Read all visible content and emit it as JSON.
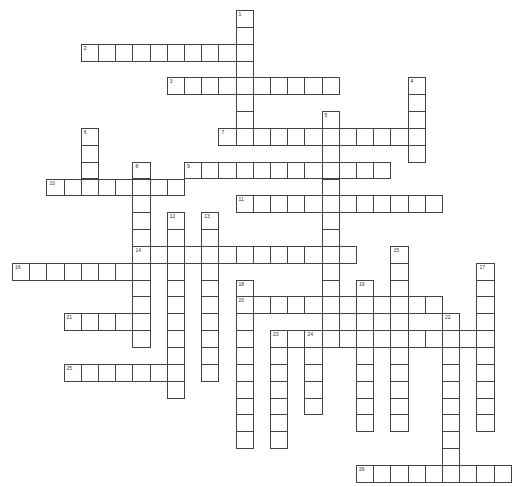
{
  "puzzle": {
    "title": "",
    "grid": {
      "x0": 12,
      "y0": 10,
      "cell_w": 17.2,
      "cell_h": 16.85,
      "border_color": "#444444"
    },
    "words": [
      {
        "number": 1,
        "dir": "down",
        "col": 13,
        "row": 0,
        "length": 8
      },
      {
        "number": 2,
        "dir": "across",
        "col": 4,
        "row": 2,
        "length": 10
      },
      {
        "number": 3,
        "dir": "across",
        "col": 9,
        "row": 4,
        "length": 10
      },
      {
        "number": 4,
        "dir": "down",
        "col": 23,
        "row": 4,
        "length": 5
      },
      {
        "number": 5,
        "dir": "down",
        "col": 18,
        "row": 6,
        "length": 14
      },
      {
        "number": 6,
        "dir": "down",
        "col": 4,
        "row": 7,
        "length": 4
      },
      {
        "number": 7,
        "dir": "across",
        "col": 12,
        "row": 7,
        "length": 12
      },
      {
        "number": 8,
        "dir": "down",
        "col": 7,
        "row": 9,
        "length": 11
      },
      {
        "number": 9,
        "dir": "across",
        "col": 10,
        "row": 9,
        "length": 12
      },
      {
        "number": 10,
        "dir": "across",
        "col": 2,
        "row": 10,
        "length": 8
      },
      {
        "number": 11,
        "dir": "across",
        "col": 13,
        "row": 11,
        "length": 12
      },
      {
        "number": 12,
        "dir": "down",
        "col": 9,
        "row": 12,
        "length": 11
      },
      {
        "number": 13,
        "dir": "down",
        "col": 11,
        "row": 12,
        "length": 10
      },
      {
        "number": 14,
        "dir": "across",
        "col": 7,
        "row": 14,
        "length": 13
      },
      {
        "number": 15,
        "dir": "down",
        "col": 22,
        "row": 14,
        "length": 11
      },
      {
        "number": 16,
        "dir": "across",
        "col": 0,
        "row": 15,
        "length": 8
      },
      {
        "number": 17,
        "dir": "down",
        "col": 27,
        "row": 15,
        "length": 10
      },
      {
        "number": 18,
        "dir": "down",
        "col": 13,
        "row": 16,
        "length": 10
      },
      {
        "number": 19,
        "dir": "down",
        "col": 20,
        "row": 16,
        "length": 9
      },
      {
        "number": 20,
        "dir": "across",
        "col": 13,
        "row": 17,
        "length": 12
      },
      {
        "number": 21,
        "dir": "across",
        "col": 3,
        "row": 18,
        "length": 5
      },
      {
        "number": 22,
        "dir": "down",
        "col": 25,
        "row": 18,
        "length": 10
      },
      {
        "number": 23,
        "dir": "down",
        "col": 15,
        "row": 19,
        "length": 7
      },
      {
        "number": 23,
        "dir": "across",
        "col": 15,
        "row": 19,
        "length": 13
      },
      {
        "number": 24,
        "dir": "down",
        "col": 17,
        "row": 19,
        "length": 5
      },
      {
        "number": 25,
        "dir": "across",
        "col": 3,
        "row": 21,
        "length": 7
      },
      {
        "number": 26,
        "dir": "across",
        "col": 20,
        "row": 27,
        "length": 9
      }
    ]
  }
}
